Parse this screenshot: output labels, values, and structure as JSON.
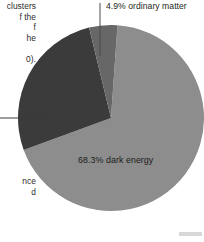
{
  "figure": {
    "background_color": "#ffffff",
    "caption_fragments": {
      "top": "clusters\nf the\nf\nhe\n\n0).",
      "middle": "",
      "bottom": "nce\nd"
    }
  },
  "chart_data": {
    "type": "pie",
    "title": "",
    "subtitle": "",
    "xlabel": "",
    "ylabel": "",
    "grid": false,
    "legend_position": "none",
    "center": {
      "x": 111,
      "y": 118
    },
    "radius": 93,
    "start_angle_deg": -86,
    "categories": [
      "dark energy",
      "dark matter",
      "ordinary matter"
    ],
    "values": [
      68.3,
      26.8,
      4.9
    ],
    "colors": [
      "#8d8d8d",
      "#3b3b3b",
      "#676767"
    ],
    "slices": [
      {
        "label": "68.3% dark energy",
        "name": "dark energy",
        "value": 68.3,
        "color": "#8d8d8d",
        "label_inside": true
      },
      {
        "label": "26.8% dark matter",
        "name": "dark matter",
        "value": 26.8,
        "color": "#3b3b3b",
        "label_inside": false,
        "leader": "left"
      },
      {
        "label": "4.9% ordinary matter",
        "name": "ordinary matter",
        "value": 4.9,
        "color": "#676767",
        "label_inside": false,
        "leader": "top"
      }
    ],
    "annotations": [
      {
        "text": "4.9% ordinary matter",
        "position": "top-right"
      },
      {
        "text": "68.3% dark energy",
        "position": "inside-lower-center"
      }
    ],
    "leader_lines": [
      {
        "name": "ordinary-matter-leader",
        "orientation": "vertical",
        "x": 100,
        "y1": 3,
        "y2": 56,
        "color": "#4a4a4a"
      },
      {
        "name": "dark-matter-leader",
        "orientation": "horizontal",
        "y": 118,
        "x1": 0,
        "x2": 47,
        "color": "#3a3a3a"
      }
    ]
  }
}
